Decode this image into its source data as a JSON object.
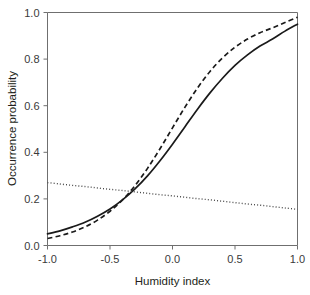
{
  "chart_data": {
    "type": "line",
    "title": "",
    "xlabel": "Humidity index",
    "ylabel": "Occurrence probability",
    "xlim": [
      -1.0,
      1.0
    ],
    "ylim": [
      0.0,
      1.0
    ],
    "grid": false,
    "legend": "none",
    "xticks": [
      "-1.0",
      "-0.5",
      "0.0",
      "0.5",
      "1.0"
    ],
    "xtick_values": [
      -1.0,
      -0.5,
      0.0,
      0.5,
      1.0
    ],
    "yticks": [
      "0.0",
      "0.2",
      "0.4",
      "0.6",
      "0.8",
      "1.0"
    ],
    "ytick_values": [
      0.0,
      0.2,
      0.4,
      0.6,
      0.8,
      1.0
    ],
    "x": [
      -1.0,
      -0.9,
      -0.8,
      -0.7,
      -0.6,
      -0.5,
      -0.4,
      -0.3,
      -0.2,
      -0.1,
      0.0,
      0.1,
      0.2,
      0.3,
      0.4,
      0.5,
      0.6,
      0.7,
      0.8,
      0.9,
      1.0
    ],
    "series": [
      {
        "name": "solid-curve",
        "style": "solid",
        "color": "#1a1a1a",
        "values": [
          0.05,
          0.063,
          0.08,
          0.1,
          0.126,
          0.157,
          0.196,
          0.243,
          0.299,
          0.364,
          0.435,
          0.51,
          0.585,
          0.655,
          0.718,
          0.773,
          0.818,
          0.856,
          0.886,
          0.92,
          0.95
        ]
      },
      {
        "name": "dashed-curve",
        "style": "dashed",
        "color": "#1a1a1a",
        "values": [
          0.03,
          0.042,
          0.058,
          0.08,
          0.109,
          0.147,
          0.196,
          0.257,
          0.331,
          0.415,
          0.505,
          0.594,
          0.676,
          0.747,
          0.805,
          0.851,
          0.886,
          0.913,
          0.934,
          0.957,
          0.98
        ]
      },
      {
        "name": "dotted-line",
        "style": "dotted",
        "color": "#4a4a4a",
        "values": [
          0.27,
          0.264,
          0.258,
          0.253,
          0.247,
          0.241,
          0.236,
          0.23,
          0.224,
          0.218,
          0.213,
          0.207,
          0.201,
          0.196,
          0.19,
          0.184,
          0.178,
          0.173,
          0.167,
          0.161,
          0.155
        ]
      }
    ]
  }
}
